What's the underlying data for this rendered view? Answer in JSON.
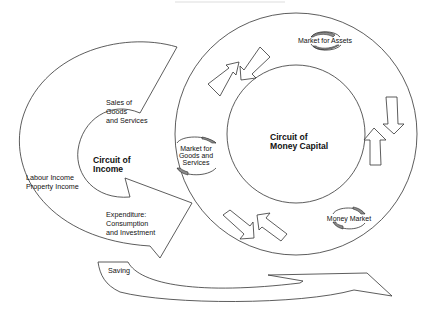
{
  "diagram": {
    "circuit_income": {
      "title_line1": "Circuit of",
      "title_line2": "Income",
      "sales_line1": "Sales of",
      "sales_line2": "Goods",
      "sales_line3": "and Services",
      "income_line1": "Labour Income",
      "income_line2": "Property Income",
      "expenditure_line1": "Expenditure:",
      "expenditure_line2": "Consumption",
      "expenditure_line3": "and Investment"
    },
    "circuit_money_capital": {
      "title_line1": "Circuit of",
      "title_line2": "Money Capital"
    },
    "markets": {
      "assets": "Market for Assets",
      "goods_line1": "Market for",
      "goods_line2": "Goods and",
      "goods_line3": "Services",
      "money": "Money Market"
    },
    "saving": "Saving",
    "colors": {
      "line": "#333333",
      "shade": "#8a8a8a",
      "background": "#ffffff"
    }
  }
}
